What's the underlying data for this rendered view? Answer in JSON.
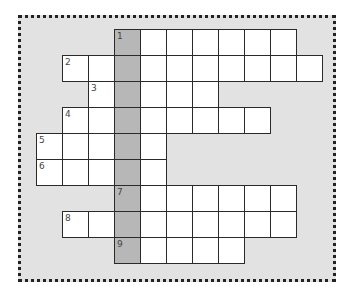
{
  "puzzle": {
    "type": "crossword",
    "origin": {
      "x": 37,
      "y": 30
    },
    "cell_size": 26,
    "highlight_column": 3,
    "colors": {
      "background": "#e2e2e2",
      "cell": "#ffffff",
      "highlight": "#b7b7b7",
      "border": "#2a2a2a"
    },
    "rows": [
      {
        "row": 0,
        "start": 3,
        "end": 9,
        "number": "1"
      },
      {
        "row": 1,
        "start": 1,
        "end": 10,
        "number": "2"
      },
      {
        "row": 2,
        "start": 2,
        "end": 6,
        "number": "3"
      },
      {
        "row": 3,
        "start": 1,
        "end": 8,
        "number": "4"
      },
      {
        "row": 4,
        "start": 0,
        "end": 4,
        "number": "5"
      },
      {
        "row": 5,
        "start": 0,
        "end": 4,
        "number": "6"
      },
      {
        "row": 6,
        "start": 3,
        "end": 9,
        "number": "7"
      },
      {
        "row": 7,
        "start": 1,
        "end": 9,
        "number": "8"
      },
      {
        "row": 8,
        "start": 3,
        "end": 7,
        "number": "9"
      }
    ]
  }
}
